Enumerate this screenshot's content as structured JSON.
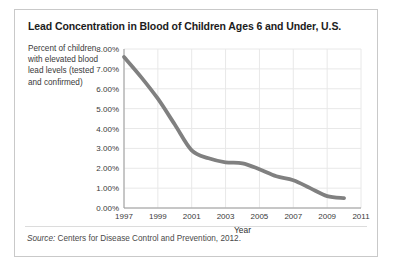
{
  "figure": {
    "title": "Lead Concentration in Blood of Children Ages 6 and Under, U.S.",
    "axis_description": "Percent of children with elevated blood lead levels (tested and confirmed)",
    "source_label": "Source:",
    "source_text": " Centers for Disease Control and Prevention, 2012.",
    "colors": {
      "line": "#808080",
      "grid": "#e8e8e8",
      "axis": "#9a9a9a",
      "panel_border": "#c9c9c9",
      "text": "#3a3a3a",
      "background": "#ffffff"
    }
  },
  "chart_data": {
    "type": "line",
    "title": "Lead Concentration in Blood of Children Ages 6 and Under, U.S.",
    "xlabel": "Year",
    "ylabel": "Percent of children with elevated blood lead levels (tested and confirmed)",
    "xlim": [
      1997,
      2011
    ],
    "ylim": [
      0,
      8
    ],
    "grid": true,
    "legend": "none",
    "y_tick_labels": [
      "0.00%",
      "1.00%",
      "2.00%",
      "3.00%",
      "4.00%",
      "5.00%",
      "6.00%",
      "7.00%",
      "8.00%"
    ],
    "y_tick_values": [
      0,
      1,
      2,
      3,
      4,
      5,
      6,
      7,
      8
    ],
    "x_tick_labels": [
      "1997",
      "1999",
      "2001",
      "2003",
      "2005",
      "2007",
      "2009",
      "2011"
    ],
    "x_tick_values": [
      1997,
      1999,
      2001,
      2003,
      2005,
      2007,
      2009,
      2011
    ],
    "series": [
      {
        "name": "Percent of children with elevated blood lead levels",
        "color": "#808080",
        "x": [
          1997,
          1998,
          1999,
          2000,
          2001,
          2002,
          2003,
          2004,
          2005,
          2006,
          2007,
          2008,
          2009,
          2010
        ],
        "values": [
          7.6,
          6.6,
          5.5,
          4.2,
          2.9,
          2.5,
          2.3,
          2.25,
          1.95,
          1.6,
          1.4,
          1.0,
          0.6,
          0.5
        ]
      }
    ]
  }
}
